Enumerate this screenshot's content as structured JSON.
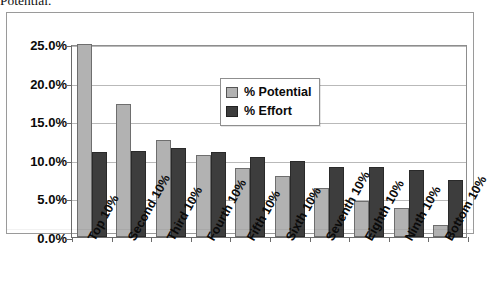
{
  "caption": {
    "text": "Potential."
  },
  "chart_data": {
    "type": "bar",
    "title": "",
    "xlabel": "",
    "ylabel": "",
    "categories": [
      "Top 10%",
      "Second 10%",
      "Third 10%",
      "Fourth 10%",
      "Fifth 10%",
      "Sixth 10%",
      "Seventh 10%",
      "Eighth 10%",
      "Ninth 10%",
      "Bottom 10%"
    ],
    "series": [
      {
        "name": "% Potential",
        "color": "#b2b2b2",
        "values": [
          25.0,
          17.2,
          12.6,
          10.6,
          8.9,
          7.9,
          6.4,
          4.7,
          3.8,
          1.6
        ]
      },
      {
        "name": "% Effort",
        "color": "#3d3d3d",
        "values": [
          11.0,
          11.2,
          11.5,
          11.0,
          10.3,
          9.8,
          9.1,
          9.1,
          8.7,
          7.4
        ]
      }
    ],
    "ylim": [
      0.0,
      25.0
    ],
    "ytick_labels": [
      "0.0%",
      "5.0%",
      "10.0%",
      "15.0%",
      "20.0%",
      "25.0%"
    ],
    "ytick_values": [
      0.0,
      5.0,
      10.0,
      15.0,
      20.0,
      25.0
    ],
    "grid": true,
    "legend_position": "inside-top-center"
  },
  "legend": {
    "items": [
      {
        "label": "% Potential",
        "swatch": "potential"
      },
      {
        "label": "% Effort",
        "swatch": "effort"
      }
    ]
  }
}
